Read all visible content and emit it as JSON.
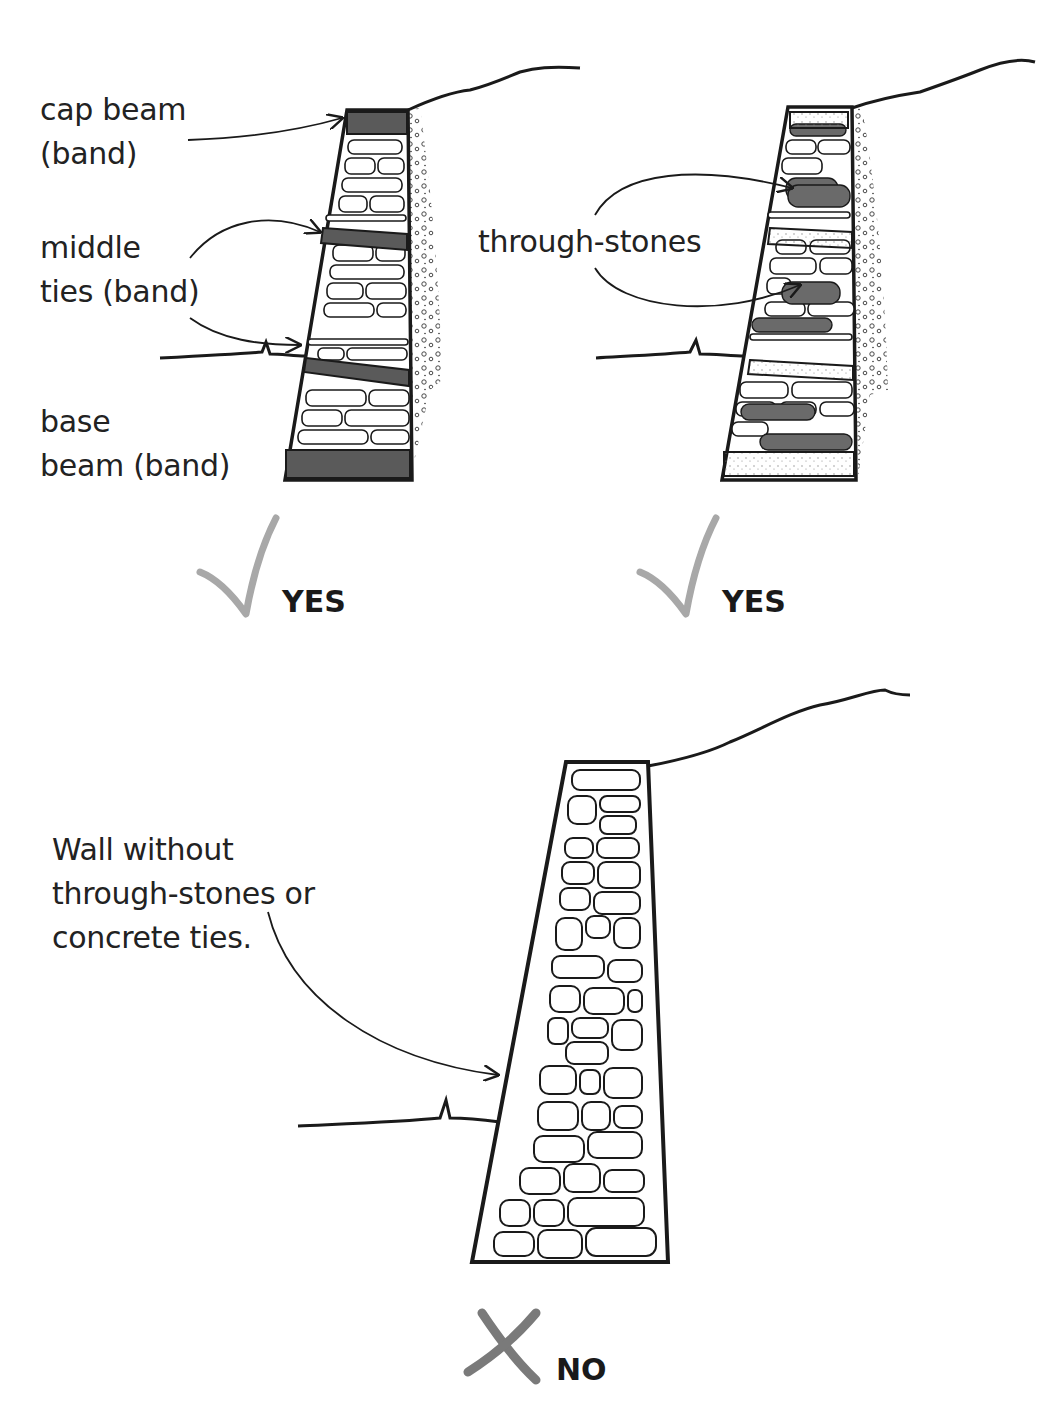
{
  "panels": [
    {
      "id": "banded-wall",
      "labels": {
        "cap_beam": "cap beam\n(band)",
        "middle_ties": "middle\nties (band)",
        "base_beam": "base\nbeam (band)"
      },
      "verdict": {
        "icon": "check-icon",
        "text": "YES"
      }
    },
    {
      "id": "through-stone-wall",
      "labels": {
        "through_stones": "through-stones"
      },
      "verdict": {
        "icon": "check-icon",
        "text": "YES"
      }
    },
    {
      "id": "plain-wall",
      "labels": {
        "wall_note": "Wall without\nthrough-stones or\nconcrete ties."
      },
      "verdict": {
        "icon": "cross-icon",
        "text": "NO"
      }
    }
  ],
  "colors": {
    "ink": "#1a1a1a",
    "band_fill": "#5a5a5a",
    "through_stone_fill": "#6a6a6a",
    "mark_gray": "#a8a8a8",
    "cross_gray": "#7a7a7a"
  }
}
